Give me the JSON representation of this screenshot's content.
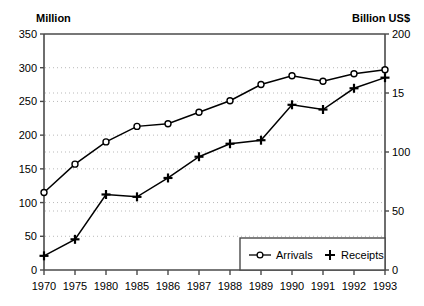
{
  "chart_data": {
    "type": "line",
    "title": "",
    "subtitle": "",
    "xlabel": "",
    "ylabel": "Million",
    "y2label": "Billion US$",
    "categories": [
      "1970",
      "1975",
      "1980",
      "1985",
      "1986",
      "1987",
      "1988",
      "1989",
      "1990",
      "1991",
      "1992",
      "1993"
    ],
    "grid": true,
    "legend_position": "bottom-right",
    "left_axis": {
      "label": "Million",
      "ticks": [
        0,
        50,
        100,
        150,
        200,
        250,
        300,
        350
      ],
      "tick_labels": [
        "0",
        "50",
        "100",
        "150",
        "200",
        "250",
        "300",
        "350"
      ],
      "ylim": [
        0,
        350
      ]
    },
    "right_axis": {
      "label": "Billion US$",
      "ticks": [
        0,
        50,
        100,
        150,
        200
      ],
      "tick_labels": [
        "0",
        "50",
        "100",
        "15",
        "200"
      ],
      "tick_labels_note": "150 label is clipped at image edge, rendered as 15",
      "ylim": [
        0,
        200
      ]
    },
    "series": [
      {
        "name": "Arrivals",
        "axis": "left",
        "unit": "Million",
        "marker": "open-circle",
        "color": "#000000",
        "values": [
          115,
          157,
          190,
          213,
          217,
          234,
          251,
          275,
          288,
          280,
          291,
          297
        ]
      },
      {
        "name": "Receipts",
        "axis": "right",
        "unit": "Billion US$",
        "marker": "plus",
        "color": "#000000",
        "values": [
          12,
          26,
          64,
          62,
          78,
          96,
          107,
          110,
          140,
          136,
          154,
          163
        ]
      }
    ]
  },
  "legend": {
    "items": [
      {
        "label": "Arrivals",
        "marker": "open-circle"
      },
      {
        "label": "Receipts",
        "marker": "plus"
      }
    ]
  },
  "colors": {
    "axis": "#4a4a4a",
    "grid": "#b9b9b9",
    "series": "#000000",
    "background": "#ffffff"
  }
}
